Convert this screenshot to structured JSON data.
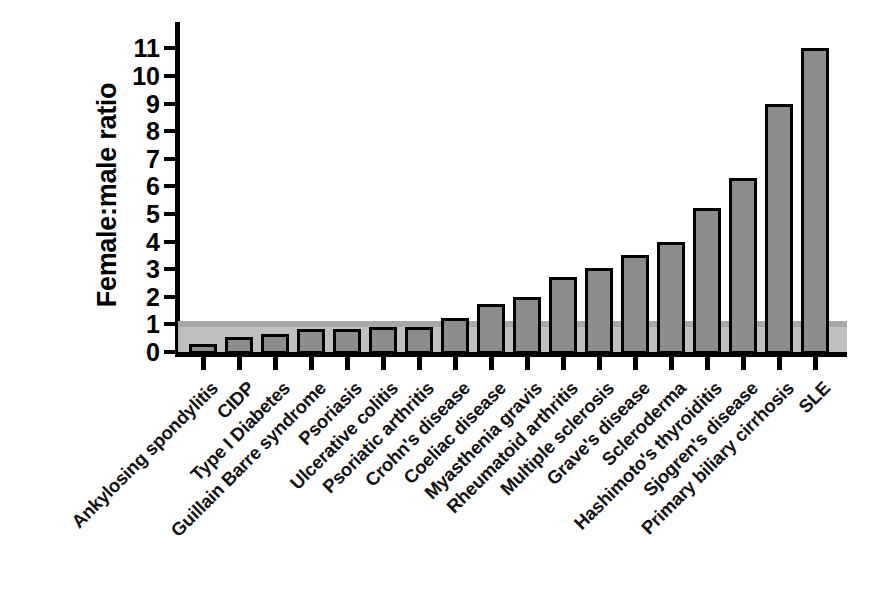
{
  "chart_data": {
    "type": "bar",
    "title": "",
    "subtitle": "",
    "xlabel": "",
    "ylabel": "Female:male ratio",
    "ylim": [
      0,
      11.6
    ],
    "ytick_labels": [
      "0",
      "1",
      "2",
      "3",
      "4",
      "5",
      "6",
      "7",
      "8",
      "9",
      "10",
      "11"
    ],
    "yticks": [
      0,
      1,
      2,
      3,
      4,
      5,
      6,
      7,
      8,
      9,
      10,
      11
    ],
    "grid": false,
    "legend": null,
    "annotations": [
      {
        "name": "unity-reference-line",
        "type": "hline",
        "value": 1,
        "color": "#a8a8a8"
      }
    ],
    "bar_fill_color": "#8c8c8c",
    "bar_edge_color": "#000000",
    "categories": [
      "Ankylosing spondylitis",
      "CIDP",
      "Type I Diabetes",
      "Guillain Barre syndrome",
      "Psoriasis",
      "Ulcerative colitis",
      "Psoriatic arthritis",
      "Crohn's disease",
      "Coeliac disease",
      "Myasthenia gravis",
      "Rheumatoid arthritis",
      "Multiple sclerosis",
      "Grave's disease",
      "Scleroderma",
      "Hashimoto's thyroiditis",
      "Sjogren's disease",
      "Primary biliary cirrhosis",
      "SLE"
    ],
    "values": [
      0.3,
      0.55,
      0.65,
      0.85,
      0.85,
      0.9,
      0.9,
      1.25,
      1.75,
      2.0,
      2.7,
      3.05,
      3.5,
      4.0,
      5.2,
      6.3,
      9.0,
      11.0
    ]
  }
}
